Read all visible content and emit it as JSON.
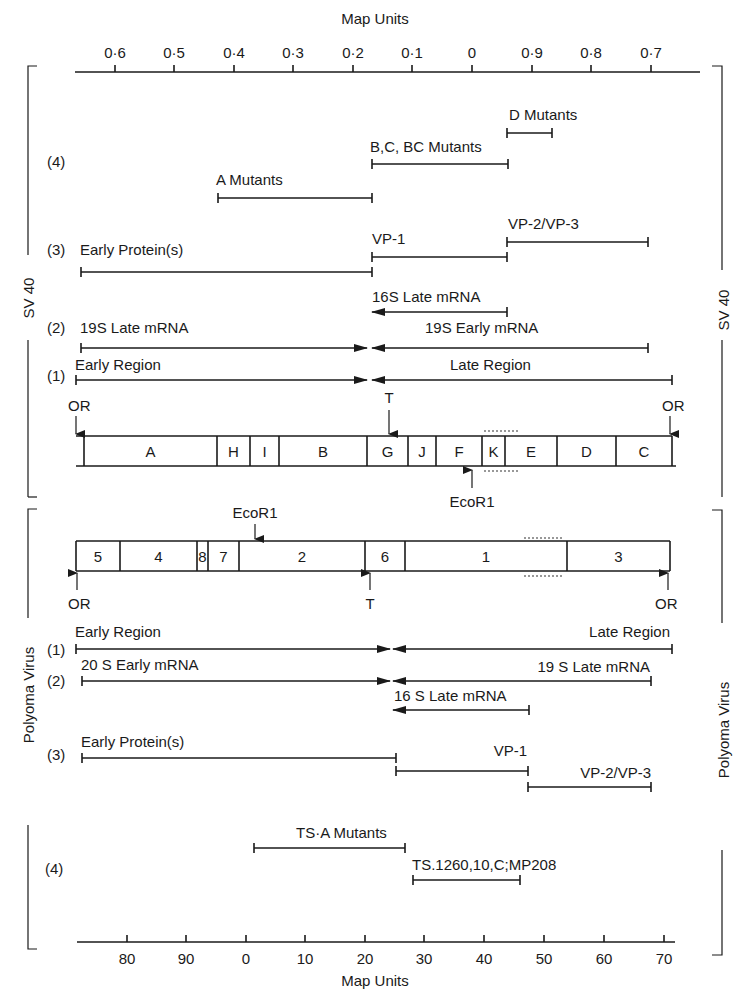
{
  "top_axis": {
    "title": "Map Units",
    "ticks": [
      {
        "label": "0·6",
        "x": 115
      },
      {
        "label": "0·5",
        "x": 174
      },
      {
        "label": "0·4",
        "x": 234
      },
      {
        "label": "0·3",
        "x": 293
      },
      {
        "label": "0·2",
        "x": 353
      },
      {
        "label": "0·1",
        "x": 412
      },
      {
        "label": "0",
        "x": 472
      },
      {
        "label": "0·9",
        "x": 532
      },
      {
        "label": "0·8",
        "x": 591
      },
      {
        "label": "0·7",
        "x": 651
      }
    ]
  },
  "bottom_axis": {
    "title": "Map Units",
    "ticks": [
      {
        "label": "80",
        "x": 127
      },
      {
        "label": "90",
        "x": 186
      },
      {
        "label": "0",
        "x": 246
      },
      {
        "label": "10",
        "x": 305
      },
      {
        "label": "20",
        "x": 365
      },
      {
        "label": "30",
        "x": 424
      },
      {
        "label": "40",
        "x": 484
      },
      {
        "label": "50",
        "x": 544
      },
      {
        "label": "60",
        "x": 604
      },
      {
        "label": "70",
        "x": 664
      }
    ]
  },
  "sv40": {
    "side_label": "SV 40",
    "rows": {
      "r4": "(4)",
      "r3": "(3)",
      "r2": "(2)",
      "r1": "(1)"
    },
    "mutants": {
      "d": "D Mutants",
      "bc": "B,C, BC Mutants",
      "a": "A Mutants"
    },
    "proteins": {
      "early": "Early Protein(s)",
      "vp1": "VP-1",
      "vp23": "VP-2/VP-3"
    },
    "mrna": {
      "late16": "16S Late mRNA",
      "late19": "19S Late mRNA",
      "early19": "19S  Early mRNA"
    },
    "regions": {
      "early": "Early Region",
      "late": "Late Region"
    },
    "markers": {
      "origin_left": "OR",
      "origin_right": "OR",
      "terminus": "T",
      "ecor1": "EcoR1"
    },
    "fragments": [
      {
        "label": "A",
        "x0": 84,
        "x1": 217
      },
      {
        "label": "H",
        "x0": 217,
        "x1": 250
      },
      {
        "label": "I",
        "x0": 250,
        "x1": 279
      },
      {
        "label": "B",
        "x0": 279,
        "x1": 367
      },
      {
        "label": "G",
        "x0": 367,
        "x1": 408
      },
      {
        "label": "J",
        "x0": 408,
        "x1": 436
      },
      {
        "label": "F",
        "x0": 436,
        "x1": 482
      },
      {
        "label": "K",
        "x0": 482,
        "x1": 505
      },
      {
        "label": "E",
        "x0": 505,
        "x1": 557
      },
      {
        "label": "D",
        "x0": 557,
        "x1": 616
      },
      {
        "label": "C",
        "x0": 616,
        "x1": 672
      }
    ]
  },
  "polyoma": {
    "side_label": "Polyoma Virus",
    "rows": {
      "r1": "(1)",
      "r2": "(2)",
      "r3": "(3)",
      "r4": "(4)"
    },
    "regions": {
      "early": "Early Region",
      "late": "Late Region"
    },
    "mrna": {
      "early20": "20 S  Early mRNA",
      "late19": "19 S  Late mRNA",
      "late16": "16 S  Late mRNA"
    },
    "proteins": {
      "early": "Early Protein(s)",
      "vp1": "VP-1",
      "vp23": "VP-2/VP-3"
    },
    "mutants": {
      "tsa": "TS·A Mutants",
      "ts1260": "TS.1260,10,C;MP208"
    },
    "markers": {
      "origin_left": "OR",
      "origin_right": "OR",
      "terminus": "T",
      "ecor1": "EcoR1"
    },
    "fragments": [
      {
        "label": "5",
        "x0": 76,
        "x1": 120
      },
      {
        "label": "4",
        "x0": 120,
        "x1": 197
      },
      {
        "label": "8",
        "x0": 197,
        "x1": 208
      },
      {
        "label": "7",
        "x0": 208,
        "x1": 239
      },
      {
        "label": "2",
        "x0": 239,
        "x1": 365
      },
      {
        "label": "6",
        "x0": 365,
        "x1": 405
      },
      {
        "label": "1",
        "x0": 405,
        "x1": 567
      },
      {
        "label": "3",
        "x0": 567,
        "x1": 670
      }
    ]
  },
  "colors": {
    "ink": "#1a1a1a",
    "background": "#ffffff"
  }
}
